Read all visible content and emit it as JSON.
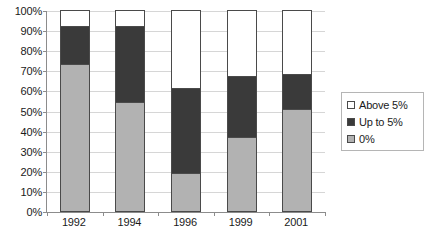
{
  "chart_data": {
    "type": "bar",
    "subtype": "stacked-bar-100pct",
    "title": "",
    "xlabel": "",
    "ylabel": "",
    "categories": [
      "1992",
      "1994",
      "1996",
      "1999",
      "2001"
    ],
    "series": [
      {
        "name": "0%",
        "color": "#b2b2b2",
        "values": [
          73,
          54,
          19,
          37,
          51
        ]
      },
      {
        "name": "Up to 5%",
        "color": "#3a3a3a",
        "values": [
          19,
          38,
          42,
          30,
          17
        ]
      },
      {
        "name": "Above 5%",
        "color": "#ffffff",
        "values": [
          8,
          8,
          39,
          33,
          32
        ]
      }
    ],
    "stack_tops": {
      "0%": [
        73,
        54,
        19,
        37,
        51
      ],
      "Up to 5%": [
        92,
        92,
        61,
        67,
        68
      ],
      "Above 5%": [
        100,
        100,
        100,
        100,
        100
      ]
    },
    "ylim": [
      0,
      100
    ],
    "ytick_values": [
      0,
      10,
      20,
      30,
      40,
      50,
      60,
      70,
      80,
      90,
      100
    ],
    "ytick_labels": [
      "0%",
      "10%",
      "20%",
      "30%",
      "40%",
      "50%",
      "60%",
      "70%",
      "80%",
      "90%",
      "100%"
    ],
    "grid": true,
    "legend_position": "right",
    "legend_order": [
      "Above 5%",
      "Up to 5%",
      "0%"
    ]
  },
  "legend": {
    "items": [
      {
        "label": "Above 5%",
        "swatch": "#ffffff"
      },
      {
        "label": "Up to 5%",
        "swatch": "#3a3a3a"
      },
      {
        "label": "0%",
        "swatch": "#b2b2b2"
      }
    ]
  },
  "colors": {
    "zero": "#b2b2b2",
    "upto5": "#3a3a3a",
    "above5": "#ffffff",
    "outline": "#4a4a4a",
    "axis": "#8c8c8c",
    "gridline": "#d6d6d6",
    "text": "#1a1a1a"
  }
}
